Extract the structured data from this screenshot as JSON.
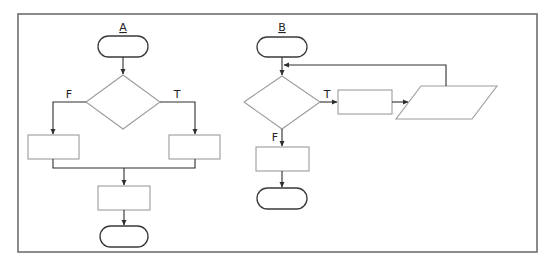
{
  "diagrams": [
    {
      "title": "A",
      "description": "If-then-else selection structure",
      "decision_labels": {
        "false": "F",
        "true": "T"
      },
      "nodes": [
        "start-terminal",
        "decision",
        "false-process",
        "true-process",
        "merge-process",
        "end-terminal"
      ]
    },
    {
      "title": "B",
      "description": "While loop structure",
      "decision_labels": {
        "true": "T",
        "false": "F"
      },
      "nodes": [
        "start-terminal",
        "decision",
        "loop-process",
        "loop-io",
        "exit-process",
        "end-terminal"
      ]
    }
  ],
  "colors": {
    "frame": "#6e6e6e",
    "box_stroke": "#9c9c9c",
    "terminal_stroke": "#3a3a3a",
    "connector": "#2e2e2e"
  }
}
